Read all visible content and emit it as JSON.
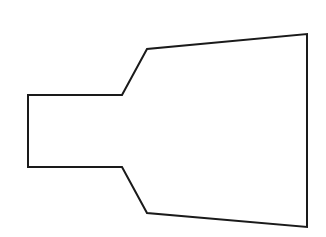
{
  "diagram": {
    "background": "#ffffff",
    "shape": {
      "type": "polygon",
      "description": "funnel-shaped outline: narrow rectangular neck on the left widening into a trapezoid on the right",
      "stroke": "#1a1a1a",
      "stroke_width": 2,
      "fill": "none",
      "points": [
        [
          28,
          95
        ],
        [
          122,
          95
        ],
        [
          147,
          49
        ],
        [
          307,
          34
        ],
        [
          307,
          227
        ],
        [
          147,
          213
        ],
        [
          122,
          167
        ],
        [
          28,
          167
        ]
      ]
    }
  }
}
